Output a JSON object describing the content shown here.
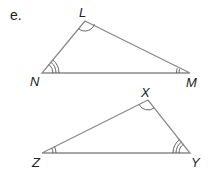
{
  "part_label": "e.",
  "triangles": [
    {
      "name": "LMN",
      "vertices": {
        "L": [
          85,
          21
        ],
        "N": [
          42,
          73
        ],
        "M": [
          190,
          73
        ]
      },
      "angle_marks": {
        "L": 1,
        "N": 3,
        "M": 2
      }
    },
    {
      "name": "XYZ",
      "vertices": {
        "X": [
          148,
          100
        ],
        "Z": [
          42,
          153
        ],
        "Y": [
          190,
          153
        ]
      },
      "angle_marks": {
        "X": 1,
        "Z": 2,
        "Y": 3
      }
    }
  ],
  "labels": {
    "L": "L",
    "N": "N",
    "M": "M",
    "X": "X",
    "Y": "Y",
    "Z": "Z"
  },
  "colors": {
    "edge": "#8a8a8a",
    "text": "#222222"
  }
}
